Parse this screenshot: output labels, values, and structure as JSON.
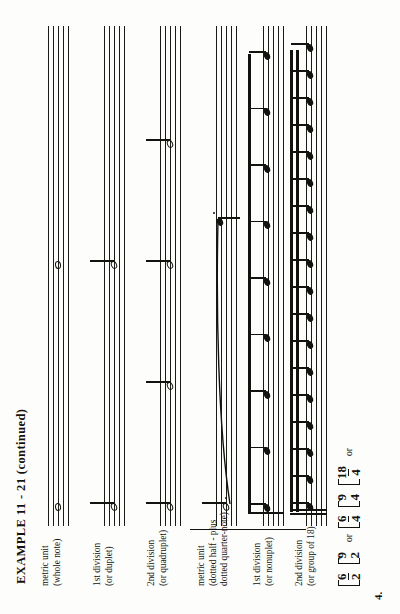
{
  "page": {
    "title": "EXAMPLE 11 - 21 (continued)",
    "item_number": "4.",
    "ink_color": "#14120f",
    "paper_color": "#fdfdfb"
  },
  "time_signatures": {
    "or_label": "or",
    "groups": [
      {
        "items": [
          {
            "numerator": "6",
            "denominator": "2",
            "style": "fraction"
          },
          {
            "numerator": "9",
            "denominator": "2",
            "style": "colon"
          }
        ]
      },
      {
        "items": [
          {
            "numerator": "6",
            "denominator": "4",
            "style": "fraction"
          },
          {
            "numerator": "9",
            "denominator": "4",
            "style": "colon"
          }
        ]
      },
      {
        "items": [
          {
            "numerator": "18",
            "denominator": "4",
            "style": "fraction"
          }
        ]
      }
    ]
  },
  "labels": [
    {
      "id": "metric-unit-whole",
      "lines": [
        "metric unit",
        "(whole note)"
      ]
    },
    {
      "id": "first-division-duplet",
      "lines": [
        "1st division",
        "(or duplet)"
      ]
    },
    {
      "id": "second-division-quadruplet",
      "lines": [
        "2nd division",
        "(or quadruplet)"
      ]
    },
    {
      "id": "metric-unit-dotted",
      "lines": [
        "metric unit",
        "(dotted half - plus",
        "dotted quarter-note)"
      ]
    },
    {
      "id": "first-division-nonuplet",
      "lines": [
        "1st division",
        "(or nonuplet)"
      ]
    },
    {
      "id": "second-division-group-of-18",
      "lines": [
        "2nd division",
        "(or group of 18)"
      ]
    }
  ],
  "chart_data": {
    "type": "table",
    "title": "EXAMPLE 11 - 21 (continued)",
    "staff_systems": [
      {
        "label": "metric unit (whole note)",
        "note_count": 2,
        "note_type": "whole",
        "beamed": false
      },
      {
        "label": "1st division (or duplet)",
        "note_count": 2,
        "note_type": "half",
        "beamed": false
      },
      {
        "label": "2nd division (or quadruplet)",
        "note_count": 4,
        "note_type": "quarter",
        "beamed": false
      },
      {
        "label": "metric unit (dotted half - plus dotted quarter-note)",
        "note_count": 2,
        "note_type": "dotted-half-and-dotted-quarter",
        "beamed": false,
        "tie": true
      },
      {
        "label": "1st division (or nonuplet)",
        "note_count": 9,
        "note_type": "eighth",
        "beamed": true,
        "beam_count": 1
      },
      {
        "label": "2nd division (or group of 18)",
        "note_count": 18,
        "note_type": "sixteenth",
        "beamed": true,
        "beam_count": 2
      }
    ]
  }
}
